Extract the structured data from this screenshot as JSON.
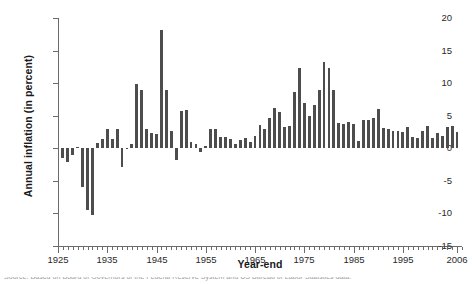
{
  "chart_data": {
    "type": "bar",
    "title": "",
    "xlabel": "Year-end",
    "ylabel": "Annual inflation (in percent)",
    "ylim": [
      -15,
      20
    ],
    "ytick_values": [
      20,
      15,
      10,
      5,
      0,
      -5,
      -10,
      -15
    ],
    "ytick_labels": [
      "20",
      "15",
      "10",
      "5",
      "0",
      "-5",
      "-10",
      "-15"
    ],
    "ygrid": false,
    "xlim": [
      1925,
      2007
    ],
    "xtick_labels": [
      "1925",
      "1935",
      "1945",
      "1955",
      "1965",
      "1975",
      "1985",
      "1995",
      "2006"
    ],
    "xtick_values": [
      1925,
      1935,
      1945,
      1955,
      1965,
      1975,
      1985,
      1995,
      2006
    ],
    "xminor_tick_step": 1,
    "bar_color": "#4d4d4d",
    "axis_color": "#6a6a6a",
    "legend": null,
    "categories": [
      1926,
      1927,
      1928,
      1929,
      1930,
      1931,
      1932,
      1933,
      1934,
      1935,
      1936,
      1937,
      1938,
      1939,
      1940,
      1941,
      1942,
      1943,
      1944,
      1945,
      1946,
      1947,
      1948,
      1949,
      1950,
      1951,
      1952,
      1953,
      1954,
      1955,
      1956,
      1957,
      1958,
      1959,
      1960,
      1961,
      1962,
      1963,
      1964,
      1965,
      1966,
      1967,
      1968,
      1969,
      1970,
      1971,
      1972,
      1973,
      1974,
      1975,
      1976,
      1977,
      1978,
      1979,
      1980,
      1981,
      1982,
      1983,
      1984,
      1985,
      1986,
      1987,
      1988,
      1989,
      1990,
      1991,
      1992,
      1993,
      1994,
      1995,
      1996,
      1997,
      1998,
      1999,
      2000,
      2001,
      2002,
      2003,
      2004,
      2005,
      2006
    ],
    "values": [
      -1.5,
      -2.1,
      -1.0,
      0.2,
      -6.0,
      -9.5,
      -10.3,
      0.8,
      1.5,
      3.0,
      1.4,
      2.9,
      -2.8,
      0.0,
      0.7,
      9.9,
      9.0,
      3.0,
      2.3,
      2.2,
      18.1,
      9.0,
      2.7,
      -1.8,
      5.8,
      5.9,
      0.9,
      0.6,
      -0.5,
      0.4,
      2.9,
      3.0,
      1.8,
      1.7,
      1.4,
      0.7,
      1.3,
      1.6,
      1.0,
      1.9,
      3.5,
      3.0,
      4.7,
      6.2,
      5.6,
      3.3,
      3.4,
      8.7,
      12.3,
      6.9,
      4.9,
      6.7,
      9.0,
      13.3,
      12.4,
      8.9,
      3.9,
      3.8,
      4.0,
      3.8,
      1.1,
      4.4,
      4.4,
      4.6,
      6.1,
      3.1,
      2.9,
      2.7,
      2.7,
      2.5,
      3.3,
      1.7,
      1.6,
      2.7,
      3.4,
      1.6,
      2.4,
      1.9,
      3.3,
      3.4,
      2.5
    ]
  },
  "caption_sliver": "Source: Based on Board of Governors of the Federal Reserve System and US Bureau of Labor Statistics data."
}
